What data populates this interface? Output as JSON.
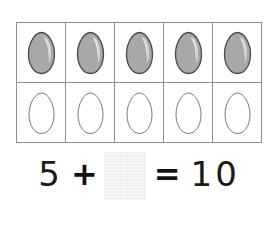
{
  "worksheet": {
    "title": "Ten frame addition with eggs",
    "ten_frame": {
      "columns": 5,
      "rows": 2,
      "rows_data": [
        {
          "row_name": "filled-eggs-row",
          "cells": [
            {
              "egg_state": "filled",
              "label": "gray-egg"
            },
            {
              "egg_state": "filled",
              "label": "gray-egg"
            },
            {
              "egg_state": "filled",
              "label": "gray-egg"
            },
            {
              "egg_state": "filled",
              "label": "gray-egg"
            },
            {
              "egg_state": "filled",
              "label": "gray-egg"
            }
          ]
        },
        {
          "row_name": "empty-eggs-row",
          "cells": [
            {
              "egg_state": "empty",
              "label": "white-egg"
            },
            {
              "egg_state": "empty",
              "label": "white-egg"
            },
            {
              "egg_state": "empty",
              "label": "white-egg"
            },
            {
              "egg_state": "empty",
              "label": "white-egg"
            },
            {
              "egg_state": "empty",
              "label": "white-egg"
            }
          ]
        }
      ]
    },
    "equation": {
      "addend_1": "5",
      "operator_plus": "+",
      "answer_blank_value": "",
      "operator_equals": "=",
      "sum": "10"
    },
    "colors": {
      "grid_border": "#8f8f8f",
      "egg_fill_gray": "#a8a8a8",
      "egg_outline": "#4a4a4a",
      "egg_highlight": "#d8d8d8",
      "blank_box": "#ededed",
      "text": "#1a1a1a",
      "page_background": "#ffffff"
    }
  }
}
